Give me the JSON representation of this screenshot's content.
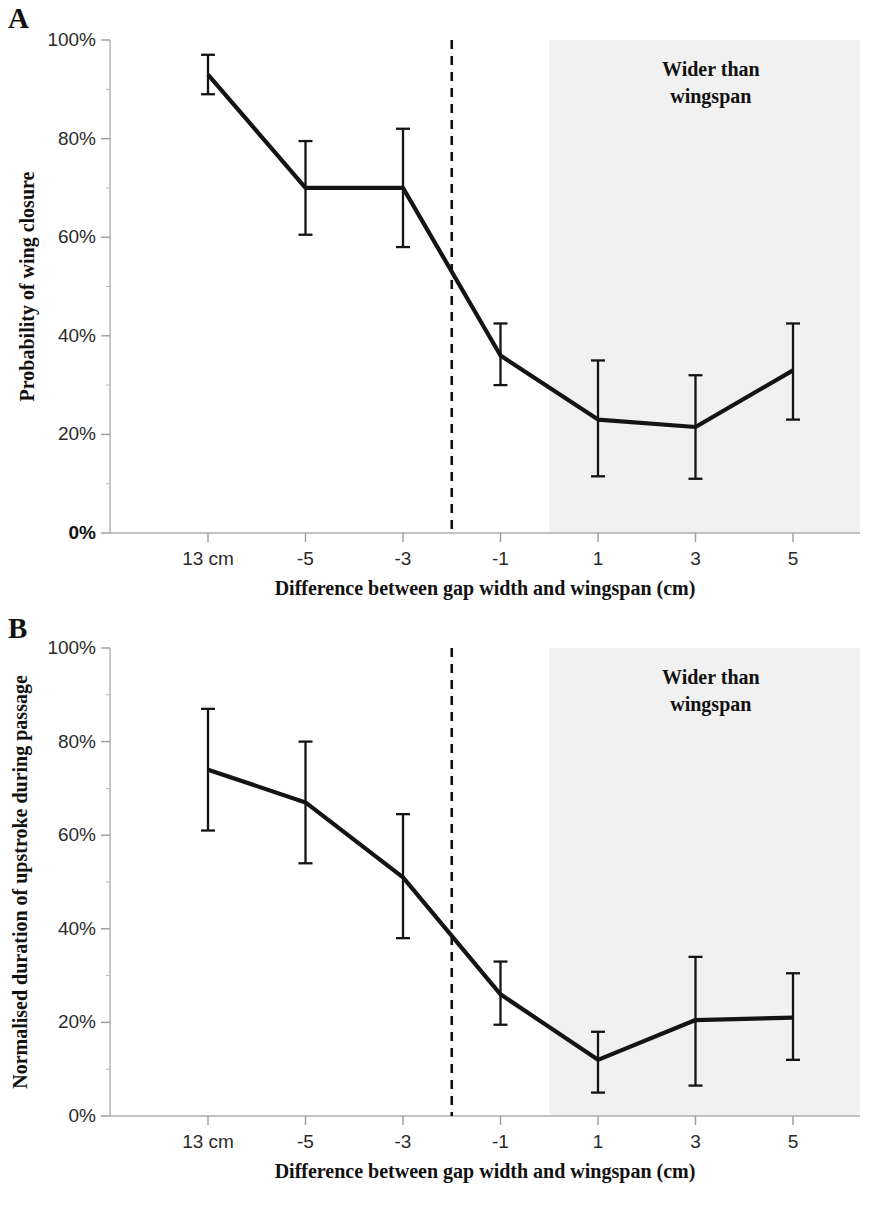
{
  "figure": {
    "panels": [
      {
        "letter": "A",
        "ylabel": "Probability of wing closure",
        "xlabel": "Difference between gap width and wingspan (cm)",
        "annotation_line1": "Wider than",
        "annotation_line2": "wingspan"
      },
      {
        "letter": "B",
        "ylabel": "Normalised duration of upstroke during passage",
        "xlabel": "Difference between gap width and wingspan (cm)",
        "annotation_line1": "Wider than",
        "annotation_line2": "wingspan"
      }
    ]
  },
  "chart_data": [
    {
      "type": "line",
      "panel": "A",
      "title": "",
      "xlabel": "Difference between gap width and wingspan (cm)",
      "ylabel": "Probability of wing closure",
      "categories": [
        "13 cm",
        "-5",
        "-3",
        "-1",
        "1",
        "3",
        "5"
      ],
      "x": [
        -7,
        -5,
        -3,
        -1,
        1,
        3,
        5
      ],
      "values": [
        93,
        70,
        70,
        36,
        23,
        21.5,
        33
      ],
      "err_low": [
        89,
        60.5,
        58,
        30,
        11.5,
        11,
        23
      ],
      "err_high": [
        97,
        79.5,
        82,
        42.5,
        35,
        32,
        42.5
      ],
      "ytick_labels": [
        "0%",
        "20%",
        "40%",
        "60%",
        "80%",
        "100%"
      ],
      "ytick_values": [
        0,
        20,
        40,
        60,
        80,
        100
      ],
      "ylim": [
        0,
        100
      ],
      "yminor_step": 10,
      "grid": false,
      "legend": "none",
      "reference_line_x": -2,
      "shaded_region_from_x": 0,
      "shaded_region_label": "Wider than wingspan"
    },
    {
      "type": "line",
      "panel": "B",
      "title": "",
      "xlabel": "Difference between gap width and wingspan (cm)",
      "ylabel": "Normalised duration of upstroke during passage",
      "categories": [
        "13 cm",
        "-5",
        "-3",
        "-1",
        "1",
        "3",
        "5"
      ],
      "x": [
        -7,
        -5,
        -3,
        -1,
        1,
        3,
        5
      ],
      "values": [
        74,
        67,
        51,
        26,
        12,
        20.5,
        21
      ],
      "err_low": [
        61,
        54,
        38,
        19.5,
        5,
        6.5,
        12
      ],
      "err_high": [
        87,
        80,
        64.5,
        33,
        18,
        34,
        30.5
      ],
      "ytick_labels": [
        "0%",
        "20%",
        "40%",
        "60%",
        "80%",
        "100%"
      ],
      "ytick_values": [
        0,
        20,
        40,
        60,
        80,
        100
      ],
      "ylim": [
        0,
        100
      ],
      "yminor_step": 10,
      "grid": false,
      "legend": "none",
      "reference_line_x": -2,
      "shaded_region_from_x": 0,
      "shaded_region_label": "Wider than wingspan"
    }
  ]
}
